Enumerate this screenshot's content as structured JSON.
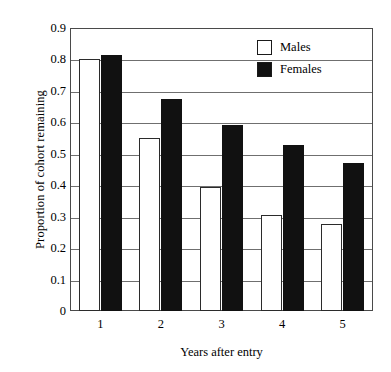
{
  "chart_data": {
    "type": "bar",
    "title": "",
    "subtitle": "",
    "xlabel": "Years after entry",
    "ylabel": "Proportion of cohort remaining",
    "categories": [
      "1",
      "2",
      "3",
      "4",
      "5"
    ],
    "series": [
      {
        "name": "Males",
        "color": "#ffffff",
        "values": [
          0.8,
          0.55,
          0.395,
          0.305,
          0.278
        ]
      },
      {
        "name": "Females",
        "color": "#111111",
        "values": [
          0.815,
          0.675,
          0.59,
          0.527,
          0.472
        ]
      }
    ],
    "ylim": [
      0,
      0.9
    ],
    "ytick_values": [
      0,
      0.1,
      0.2,
      0.3,
      0.4,
      0.5,
      0.6,
      0.7,
      0.8,
      0.9
    ],
    "ytick_labels": [
      "0",
      "0.1",
      "0.2",
      "0.3",
      "0.4",
      "0.5",
      "0.6",
      "0.7",
      "0.8",
      "0.9"
    ],
    "grid": true,
    "grid_axis": "y",
    "legend_position": "top-right",
    "legend": [
      "Males",
      "Females"
    ],
    "frame": "box",
    "axis_color": "#4a4a4a",
    "grid_color": "#6f6f6f"
  }
}
